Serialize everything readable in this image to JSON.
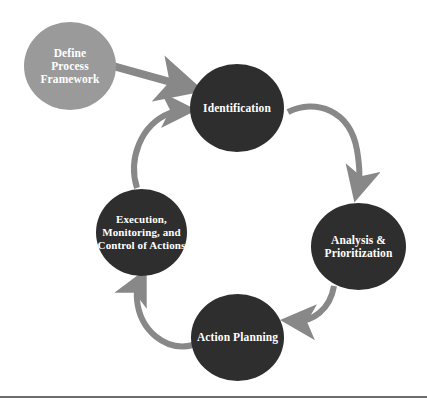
{
  "diagram": {
    "start_node": {
      "label": "Define\nProcess\nFramework",
      "color": "#9a9a9a"
    },
    "cycle_nodes": [
      {
        "label": "Identification"
      },
      {
        "label": "Analysis &\nPrioritization"
      },
      {
        "label": "Action Planning"
      },
      {
        "label": "Execution,\nMonitoring, and\nControl of Actions"
      }
    ],
    "node_color": "#2e2e2e",
    "arrow_color": "#888888",
    "edges": [
      {
        "from": "Define Process Framework",
        "to": "Identification",
        "style": "straight"
      },
      {
        "from": "Identification",
        "to": "Analysis & Prioritization",
        "style": "curved"
      },
      {
        "from": "Analysis & Prioritization",
        "to": "Action Planning",
        "style": "curved"
      },
      {
        "from": "Action Planning",
        "to": "Execution, Monitoring, and Control of Actions",
        "style": "curved"
      },
      {
        "from": "Execution, Monitoring, and Control of Actions",
        "to": "Identification",
        "style": "curved"
      }
    ]
  }
}
